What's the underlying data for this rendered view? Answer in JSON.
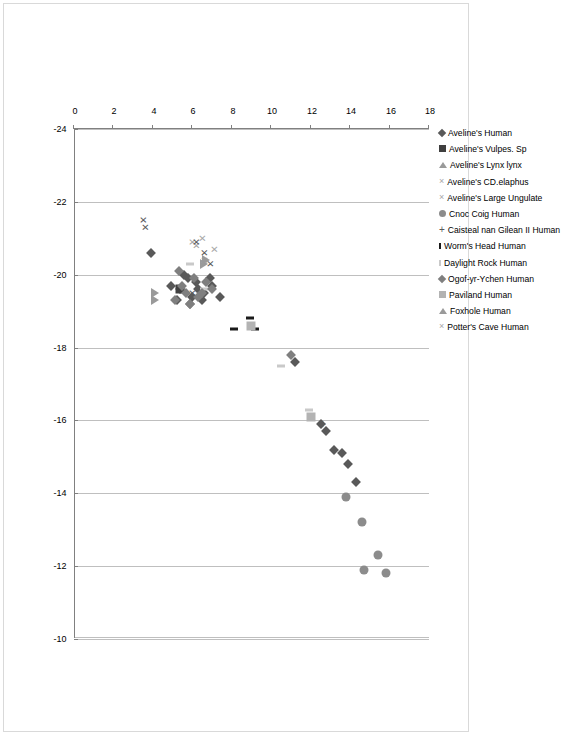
{
  "chart_data": {
    "type": "scatter",
    "title": "",
    "xlabel": "",
    "ylabel": "",
    "orientation": "rotated-90-clockwise",
    "grid": true,
    "legend_position": "top",
    "xaxis": {
      "name": "delta13C",
      "ticks": [
        "-24",
        "-22",
        "-20",
        "-18",
        "-16",
        "-14",
        "-12",
        "-10"
      ],
      "values": [
        -24,
        -22,
        -20,
        -18,
        -16,
        -14,
        -12,
        -10
      ],
      "min": -24,
      "max": -10
    },
    "yaxis": {
      "name": "delta15N",
      "ticks": [
        "0",
        "2",
        "4",
        "6",
        "8",
        "10",
        "12",
        "14",
        "16",
        "18"
      ],
      "values": [
        0,
        2,
        4,
        6,
        8,
        10,
        12,
        14,
        16,
        18
      ],
      "min": 0,
      "max": 18
    },
    "series": [
      {
        "name": "Aveline's Human",
        "marker": "diamond",
        "color": "#595959",
        "points": [
          [
            -14.3,
            14.3
          ],
          [
            -14.8,
            13.9
          ],
          [
            -15.1,
            13.6
          ],
          [
            -15.2,
            13.2
          ],
          [
            -15.7,
            12.8
          ],
          [
            -15.9,
            12.5
          ],
          [
            -17.6,
            11.2
          ],
          [
            -19.4,
            7.4
          ],
          [
            -19.7,
            7.0
          ],
          [
            -19.9,
            6.9
          ],
          [
            -19.5,
            6.6
          ],
          [
            -19.3,
            6.5
          ],
          [
            -19.6,
            6.3
          ],
          [
            -19.8,
            6.2
          ],
          [
            -19.4,
            6.0
          ],
          [
            -19.2,
            5.9
          ],
          [
            -19.9,
            5.8
          ],
          [
            -20.0,
            5.6
          ],
          [
            -19.6,
            5.4
          ],
          [
            -19.3,
            5.2
          ],
          [
            -19.7,
            4.9
          ],
          [
            -20.6,
            3.9
          ]
        ]
      },
      {
        "name": "Aveline's Vulpes. Sp",
        "marker": "square-dark",
        "color": "#404040",
        "points": [
          [
            -19.6,
            5.4
          ]
        ]
      },
      {
        "name": "Aveline's Lynx lynx",
        "marker": "triangle",
        "color": "#9a9a9a",
        "points": [
          [
            -19.5,
            4.1
          ],
          [
            -20.3,
            6.6
          ]
        ]
      },
      {
        "name": "Aveline's CD.elaphus",
        "marker": "x",
        "color": "#a6a6a6",
        "points": [
          [
            -20.7,
            7.1
          ],
          [
            -21.0,
            6.5
          ],
          [
            -20.8,
            6.2
          ],
          [
            -20.4,
            6.6
          ]
        ]
      },
      {
        "name": "Aveline's Large Ungulate",
        "marker": "x",
        "color": "#bfbfbf",
        "points": [
          [
            -20.9,
            6.0
          ]
        ]
      },
      {
        "name": "Cnoc Coig Human",
        "marker": "circle",
        "color": "#8c8c8c",
        "points": [
          [
            -11.8,
            15.8
          ],
          [
            -12.3,
            15.4
          ],
          [
            -11.9,
            14.7
          ],
          [
            -13.2,
            14.6
          ],
          [
            -13.9,
            13.8
          ]
        ]
      },
      {
        "name": "Caisteal nan Gilean II Human",
        "marker": "plus",
        "color": "#595959",
        "points": [
          [
            -15.9,
            12.6
          ]
        ]
      },
      {
        "name": "Worm's Head Human",
        "marker": "dash-dark",
        "color": "#1a1a1a",
        "points": [
          [
            -18.5,
            9.2
          ],
          [
            -18.5,
            8.1
          ],
          [
            -18.8,
            8.9
          ]
        ]
      },
      {
        "name": "Daylight Rock Human",
        "marker": "dash-light",
        "color": "#c9c9c9",
        "points": [
          [
            -16.3,
            11.9
          ],
          [
            -17.5,
            10.5
          ],
          [
            -20.3,
            5.9
          ],
          [
            -19.6,
            6.6
          ]
        ]
      },
      {
        "name": "Ogof-yr-Ychen Human",
        "marker": "diamond-light",
        "color": "#7f7f7f",
        "points": [
          [
            -19.6,
            7.0
          ],
          [
            -19.8,
            6.7
          ],
          [
            -19.5,
            6.5
          ],
          [
            -19.4,
            6.3
          ],
          [
            -19.9,
            6.1
          ],
          [
            -19.2,
            5.9
          ],
          [
            -19.5,
            5.7
          ],
          [
            -19.7,
            5.5
          ],
          [
            -20.1,
            5.3
          ],
          [
            -19.3,
            5.1
          ],
          [
            -17.8,
            11.0
          ]
        ]
      },
      {
        "name": "Paviland Human",
        "marker": "square-light",
        "color": "#b3b3b3",
        "points": [
          [
            -18.6,
            9.0
          ],
          [
            -16.1,
            12.0
          ]
        ]
      },
      {
        "name": "Foxhole Human",
        "marker": "triangle",
        "color": "#9a9a9a",
        "points": [
          [
            -19.3,
            4.1
          ],
          [
            -20.4,
            6.7
          ]
        ]
      },
      {
        "name": "Potter's Cave Human",
        "marker": "x",
        "color": "#595959",
        "points": [
          [
            -19.5,
            6.0
          ],
          [
            -21.5,
            3.5
          ],
          [
            -21.3,
            3.6
          ],
          [
            -20.6,
            6.6
          ],
          [
            -20.9,
            6.2
          ],
          [
            -20.3,
            6.9
          ]
        ]
      }
    ]
  },
  "legend": {
    "items": [
      {
        "label": "Aveline's Human",
        "marker": "diamond"
      },
      {
        "label": "Aveline's Vulpes. Sp",
        "marker": "square-dark"
      },
      {
        "label": "Aveline's Lynx lynx",
        "marker": "triangle"
      },
      {
        "label": "Aveline's CD.elaphus",
        "marker": "x-light"
      },
      {
        "label": "Aveline's Large Ungulate",
        "marker": "x-light"
      },
      {
        "label": "Cnoc Coig Human",
        "marker": "circle"
      },
      {
        "label": "Caisteal nan Gilean II Human",
        "marker": "plus"
      },
      {
        "label": "Worm's Head Human",
        "marker": "dash-dark"
      },
      {
        "label": "Daylight Rock Human",
        "marker": "dash-light"
      },
      {
        "label": "Ogof-yr-Ychen Human",
        "marker": "diamond-light"
      },
      {
        "label": "Paviland Human",
        "marker": "square-light"
      },
      {
        "label": "Foxhole Human",
        "marker": "triangle"
      },
      {
        "label": "Potter's Cave Human",
        "marker": "x-light"
      }
    ]
  },
  "axis_labels": {
    "y_ticks": [
      "18",
      "16",
      "14",
      "12",
      "10",
      "8",
      "6",
      "4",
      "2",
      "0"
    ],
    "x_ticks": [
      "-24",
      "-22",
      "-20",
      "-18",
      "-16",
      "-14",
      "-12",
      "-10"
    ]
  },
  "colors": {
    "grid": "#bfbfbf",
    "axis": "#808080",
    "dark_marker": "#595959",
    "light_marker": "#b3b3b3",
    "background": "#ffffff"
  }
}
